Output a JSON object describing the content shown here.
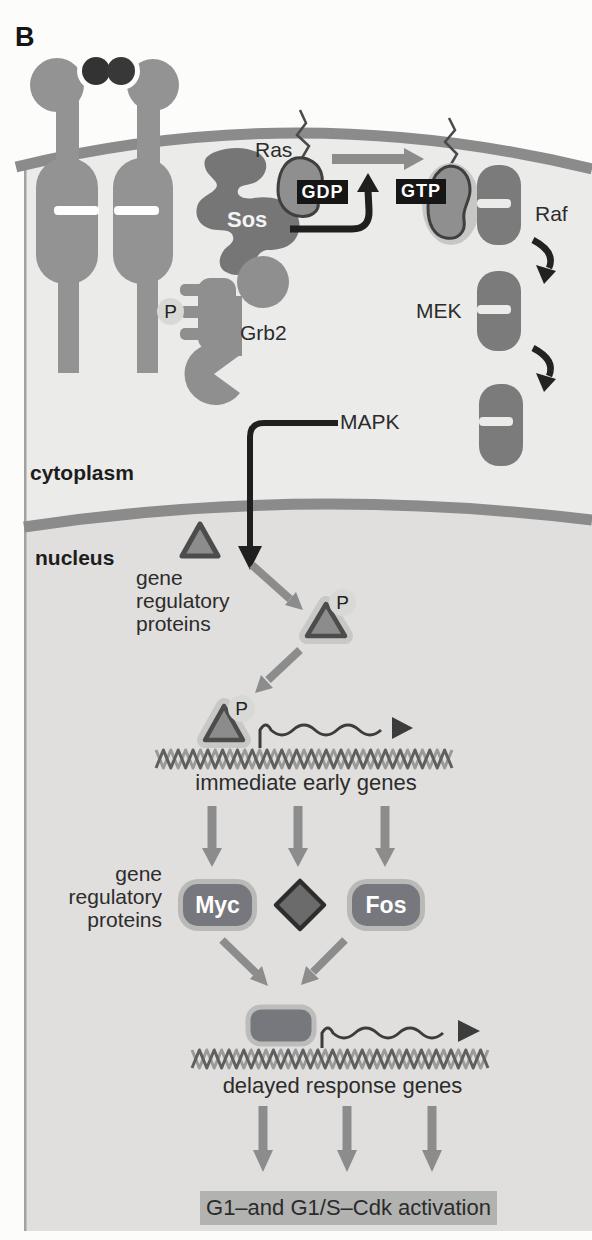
{
  "panel_label": "B",
  "compartments": {
    "cytoplasm_label": "cytoplasm",
    "nucleus_label": "nucleus"
  },
  "signaling": {
    "ras_label": "Ras",
    "sos_label": "Sos",
    "grb2_label": "Grb2",
    "gdp_label": "GDP",
    "gtp_label": "GTP",
    "raf_label": "Raf",
    "mek_label": "MEK",
    "mapk_label": "MAPK",
    "phosphate_label": "P"
  },
  "nucleus_pathway": {
    "grp_lines": [
      "gene",
      "regulatory",
      "proteins"
    ],
    "immediate_early_genes": "immediate early genes",
    "myc_label": "Myc",
    "fos_label": "Fos",
    "delayed_response_genes": "delayed response genes",
    "g1_activation": "G1–and G1/S–Cdk activation"
  },
  "colors": {
    "membrane": "#8b8b8b",
    "cytoplasm_fill": "#ebebe9",
    "nucleus_fill": "#e0dfdd",
    "protein_gray": "#939393",
    "dark_protein_gray": "#767676",
    "nucleotide_box": "#161616",
    "gene_box_fill": "#76787d",
    "activation_box": "#b2b2b0"
  }
}
